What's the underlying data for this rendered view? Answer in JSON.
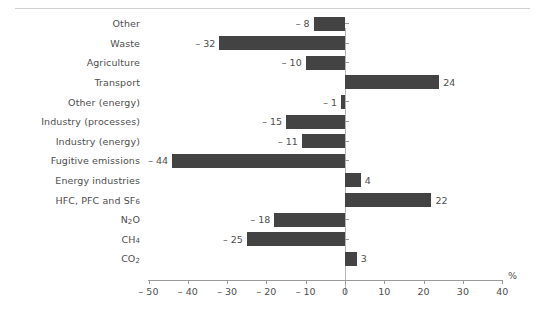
{
  "chart_data": {
    "type": "bar",
    "orientation": "horizontal",
    "title": "",
    "subtitle": "",
    "xlabel": "%",
    "ylabel": "",
    "xlim": [
      -50,
      40
    ],
    "xticks": [
      -50,
      -40,
      -30,
      -20,
      -10,
      0,
      10,
      20,
      30,
      40
    ],
    "xtick_labels": [
      "– 50",
      "– 40",
      "– 30",
      "– 20",
      "– 10",
      "0",
      "10",
      "20",
      "30",
      "40"
    ],
    "grid": false,
    "legend": "none",
    "bar_color": "#434343",
    "axis_color": "#9a9a9a",
    "text_color": "#4e4e4e",
    "categories": [
      "Other",
      "Waste",
      "Agriculture",
      "Transport",
      "Other (energy)",
      "Industry (processes)",
      "Industry (energy)",
      "Fugitive emissions",
      "Energy industries",
      "HFC, PFC and SF6",
      "N2O",
      "CH4",
      "CO2"
    ],
    "values": [
      -8,
      -32,
      -10,
      24,
      -1,
      -15,
      -11,
      -44,
      4,
      22,
      -18,
      -25,
      3
    ],
    "value_labels": [
      "– 8",
      "– 32",
      "– 10",
      "24",
      "– 1",
      "– 15",
      "– 11",
      "– 44",
      "4",
      "22",
      "– 18",
      "– 25",
      "3"
    ],
    "category_labels_rich": [
      {
        "text": "Other",
        "sub": "",
        "tail": ""
      },
      {
        "text": "Waste",
        "sub": "",
        "tail": ""
      },
      {
        "text": "Agriculture",
        "sub": "",
        "tail": ""
      },
      {
        "text": "Transport",
        "sub": "",
        "tail": ""
      },
      {
        "text": "Other (energy)",
        "sub": "",
        "tail": ""
      },
      {
        "text": "Industry (processes)",
        "sub": "",
        "tail": ""
      },
      {
        "text": "Industry (energy)",
        "sub": "",
        "tail": ""
      },
      {
        "text": "Fugitive emissions",
        "sub": "",
        "tail": ""
      },
      {
        "text": "Energy industries",
        "sub": "",
        "tail": ""
      },
      {
        "text": "HFC, PFC and SF",
        "sub": "6",
        "tail": ""
      },
      {
        "text": "N",
        "sub": "2",
        "tail": "O"
      },
      {
        "text": "CH",
        "sub": "4",
        "tail": ""
      },
      {
        "text": "CO",
        "sub": "2",
        "tail": ""
      }
    ]
  }
}
